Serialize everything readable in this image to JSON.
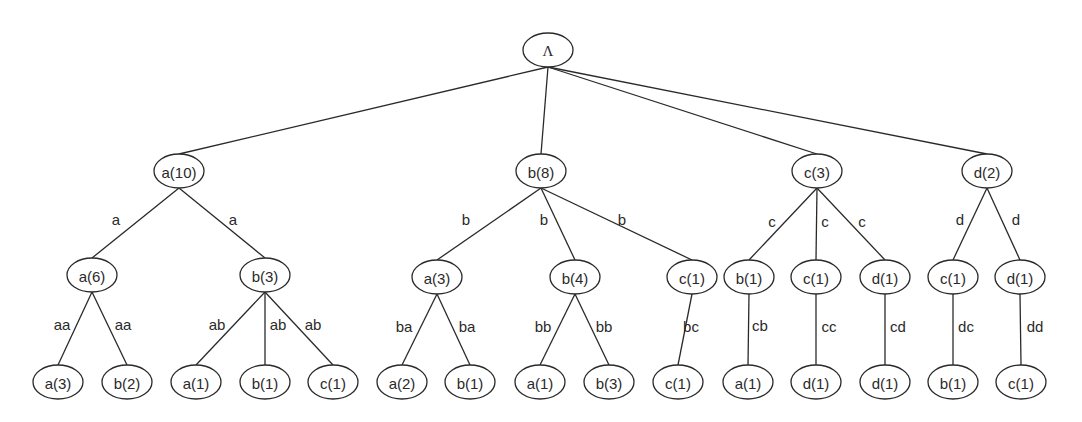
{
  "diagram": {
    "type": "tree",
    "root": {
      "id": "root",
      "label": "Λ",
      "x": 548,
      "y": 50,
      "rx": 25,
      "ry": 17
    },
    "nodes": [
      {
        "id": "n_a",
        "label": "a(10)",
        "x": 179,
        "y": 171,
        "parent": "root",
        "edge_label": "",
        "lx": 0,
        "ly": 0
      },
      {
        "id": "n_b",
        "label": "b(8)",
        "x": 541,
        "y": 171,
        "parent": "root",
        "edge_label": "",
        "lx": 0,
        "ly": 0
      },
      {
        "id": "n_c",
        "label": "c(3)",
        "x": 817,
        "y": 171,
        "parent": "root",
        "edge_label": "",
        "lx": 0,
        "ly": 0
      },
      {
        "id": "n_d",
        "label": "d(2)",
        "x": 987,
        "y": 171,
        "parent": "root",
        "edge_label": "",
        "lx": 0,
        "ly": 0
      },
      {
        "id": "n_aa",
        "label": "a(6)",
        "x": 92,
        "y": 275,
        "parent": "n_a",
        "edge_label": "a",
        "lx": 116,
        "ly": 219
      },
      {
        "id": "n_ab",
        "label": "b(3)",
        "x": 265,
        "y": 275,
        "parent": "n_a",
        "edge_label": "a",
        "lx": 233,
        "ly": 219
      },
      {
        "id": "n_ba",
        "label": "a(3)",
        "x": 437,
        "y": 277,
        "parent": "n_b",
        "edge_label": "b",
        "lx": 466,
        "ly": 219
      },
      {
        "id": "n_bb",
        "label": "b(4)",
        "x": 575,
        "y": 277,
        "parent": "n_b",
        "edge_label": "b",
        "lx": 544,
        "ly": 219
      },
      {
        "id": "n_bc",
        "label": "c(1)",
        "x": 692,
        "y": 277,
        "parent": "n_b",
        "edge_label": "b",
        "lx": 622,
        "ly": 219
      },
      {
        "id": "n_cb",
        "label": "b(1)",
        "x": 749,
        "y": 277,
        "parent": "n_c",
        "edge_label": "c",
        "lx": 772,
        "ly": 221
      },
      {
        "id": "n_cc",
        "label": "c(1)",
        "x": 816,
        "y": 277,
        "parent": "n_c",
        "edge_label": "c",
        "lx": 825,
        "ly": 221
      },
      {
        "id": "n_cd",
        "label": "d(1)",
        "x": 885,
        "y": 277,
        "parent": "n_c",
        "edge_label": "c",
        "lx": 862,
        "ly": 221
      },
      {
        "id": "n_dc",
        "label": "c(1)",
        "x": 953,
        "y": 277,
        "parent": "n_d",
        "edge_label": "d",
        "lx": 960,
        "ly": 219
      },
      {
        "id": "n_dd",
        "label": "d(1)",
        "x": 1020,
        "y": 277,
        "parent": "n_d",
        "edge_label": "d",
        "lx": 1016,
        "ly": 219
      },
      {
        "id": "n_aaa",
        "label": "a(3)",
        "x": 58,
        "y": 382,
        "parent": "n_aa",
        "edge_label": "aa",
        "lx": 62,
        "ly": 324
      },
      {
        "id": "n_aab",
        "label": "b(2)",
        "x": 127,
        "y": 382,
        "parent": "n_aa",
        "edge_label": "aa",
        "lx": 123,
        "ly": 324
      },
      {
        "id": "n_aba",
        "label": "a(1)",
        "x": 196,
        "y": 382,
        "parent": "n_ab",
        "edge_label": "ab",
        "lx": 217,
        "ly": 324
      },
      {
        "id": "n_abb",
        "label": "b(1)",
        "x": 265,
        "y": 382,
        "parent": "n_ab",
        "edge_label": "ab",
        "lx": 278,
        "ly": 324
      },
      {
        "id": "n_abc",
        "label": "c(1)",
        "x": 333,
        "y": 382,
        "parent": "n_ab",
        "edge_label": "ab",
        "lx": 313,
        "ly": 324
      },
      {
        "id": "n_baa",
        "label": "a(2)",
        "x": 402,
        "y": 382,
        "parent": "n_ba",
        "edge_label": "ba",
        "lx": 404,
        "ly": 326
      },
      {
        "id": "n_bab",
        "label": "b(1)",
        "x": 470,
        "y": 382,
        "parent": "n_ba",
        "edge_label": "ba",
        "lx": 467,
        "ly": 326
      },
      {
        "id": "n_bba",
        "label": "a(1)",
        "x": 540,
        "y": 382,
        "parent": "n_bb",
        "edge_label": "bb",
        "lx": 543,
        "ly": 326
      },
      {
        "id": "n_bbb",
        "label": "b(3)",
        "x": 609,
        "y": 382,
        "parent": "n_bb",
        "edge_label": "bb",
        "lx": 604,
        "ly": 326
      },
      {
        "id": "n_bcc",
        "label": "c(1)",
        "x": 678,
        "y": 382,
        "parent": "n_bc",
        "edge_label": "bc",
        "lx": 691,
        "ly": 326
      },
      {
        "id": "n_cba",
        "label": "a(1)",
        "x": 748,
        "y": 382,
        "parent": "n_cb",
        "edge_label": "cb",
        "lx": 760,
        "ly": 325
      },
      {
        "id": "n_ccd",
        "label": "d(1)",
        "x": 816,
        "y": 382,
        "parent": "n_cc",
        "edge_label": "cc",
        "lx": 829,
        "ly": 326
      },
      {
        "id": "n_cdd",
        "label": "d(1)",
        "x": 885,
        "y": 382,
        "parent": "n_cd",
        "edge_label": "cd",
        "lx": 898,
        "ly": 326
      },
      {
        "id": "n_dcb",
        "label": "b(1)",
        "x": 953,
        "y": 382,
        "parent": "n_dc",
        "edge_label": "dc",
        "lx": 966,
        "ly": 326
      },
      {
        "id": "n_ddc",
        "label": "c(1)",
        "x": 1021,
        "y": 382,
        "parent": "n_dd",
        "edge_label": "dd",
        "lx": 1035,
        "ly": 326
      }
    ],
    "style": {
      "node_rx": 25,
      "node_ry": 17,
      "stroke": "#2a2a2a",
      "background": "#ffffff"
    }
  }
}
